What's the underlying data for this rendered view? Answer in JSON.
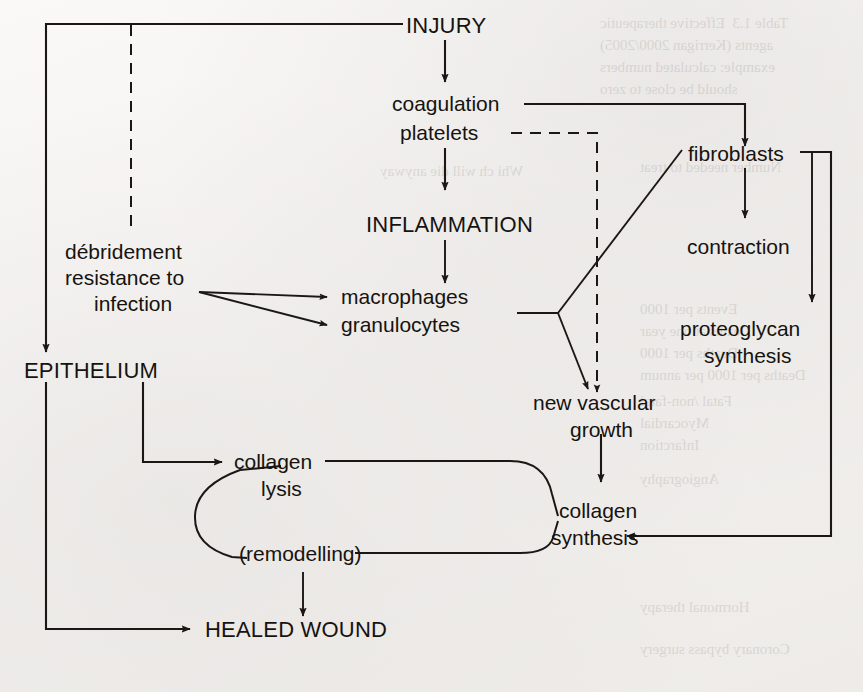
{
  "figure": {
    "type": "flowchart",
    "background_color": "#f3f1ef",
    "ink_color": "#1a1714"
  },
  "nodes": {
    "injury": "INJURY",
    "coagulation": "coagulation",
    "platelets": "platelets",
    "inflammation": "INFLAMMATION",
    "macrophages": "macrophages",
    "granulocytes": "granulocytes",
    "debridement_l1": "débridement",
    "debridement_l2": "resistance to",
    "debridement_l3": "infection",
    "epithelium": "EPITHELIUM",
    "fibroblasts": "fibroblasts",
    "contraction": "contraction",
    "proteoglycan_l1": "proteoglycan",
    "proteoglycan_l2": "synthesis",
    "new_vascular_l1": "new vascular",
    "new_vascular_l2": "growth",
    "collagen_lysis_l1": "collagen",
    "collagen_lysis_l2": "lysis",
    "collagen_synthesis_l1": "collagen",
    "collagen_synthesis_l2": "synthesis",
    "remodelling": "(remodelling)",
    "healed_wound": "HEALED WOUND"
  },
  "edges": [
    {
      "from": "injury",
      "to": "coagulation",
      "style": "solid-arrow"
    },
    {
      "from": "injury",
      "to": "epithelium",
      "style": "solid-arrow-elbow-left"
    },
    {
      "from": "injury",
      "to": "debridement",
      "style": "dashed-elbow-left"
    },
    {
      "from": "coagulation",
      "to": "fibroblasts",
      "style": "solid-arrow-elbow-right"
    },
    {
      "from": "platelets",
      "to": "new-vascular-growth",
      "style": "dashed-elbow-right"
    },
    {
      "from": "platelets",
      "to": "inflammation",
      "style": "solid-arrow"
    },
    {
      "from": "inflammation",
      "to": "macrophages",
      "style": "solid-arrow"
    },
    {
      "from": "debridement",
      "to": "macrophages",
      "style": "solid-arrow"
    },
    {
      "from": "debridement",
      "to": "granulocytes",
      "style": "solid-arrow"
    },
    {
      "from": "macrophages-granulocytes",
      "to": "fibroblasts",
      "style": "solid-branch"
    },
    {
      "from": "macrophages-granulocytes",
      "to": "new-vascular-growth",
      "style": "solid-arrow-branch"
    },
    {
      "from": "fibroblasts",
      "to": "contraction",
      "style": "solid-arrow"
    },
    {
      "from": "fibroblasts",
      "to": "proteoglycan-synthesis",
      "style": "solid-arrow-elbow-right"
    },
    {
      "from": "fibroblasts",
      "to": "collagen-synthesis",
      "style": "solid-arrow-elbow-right-long"
    },
    {
      "from": "new-vascular-growth",
      "to": "collagen-synthesis",
      "style": "solid-arrow"
    },
    {
      "from": "epithelium",
      "to": "collagen-lysis",
      "style": "solid-arrow-elbow"
    },
    {
      "from": "epithelium",
      "to": "healed-wound",
      "style": "solid-arrow-elbow"
    },
    {
      "from": "collagen-lysis",
      "to": "collagen-synthesis",
      "style": "rounded-loop"
    },
    {
      "from": "collagen-synthesis",
      "to": "remodelling",
      "style": "rounded-loop"
    },
    {
      "from": "collagen-lysis",
      "to": "remodelling",
      "style": "c-curve"
    },
    {
      "from": "remodelling",
      "to": "healed-wound",
      "style": "solid-arrow"
    }
  ],
  "ghost_text": {
    "note": "faint bleed-through of a table from the reverse page",
    "lines": [
      "Table 1.3  Effective therapeutic",
      "agents (Kerrigan 2000/2005)",
      "example: calculated numbers",
      "should be close to zero",
      "Number needed to treat",
      "Whi ch will die anyway",
      "Events per 1000",
      "Deaths at one year",
      "Deaths per 1000",
      "Deaths per 1000 per annum",
      "Fatal /non-fatal",
      "Myocardial",
      "Infarction",
      "Angiography",
      "Hormonal therapy",
      "Coronary bypass surgery"
    ]
  }
}
